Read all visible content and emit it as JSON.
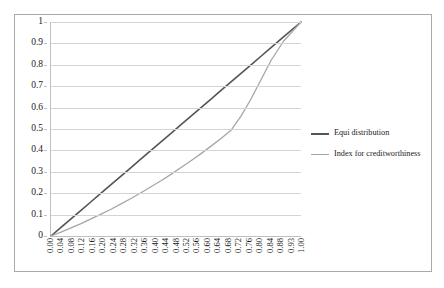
{
  "chart_data": {
    "type": "line",
    "title": "",
    "subtitle": "",
    "xlabel": "",
    "ylabel": "",
    "grid": true,
    "legend_position": "right",
    "xlim": [
      0,
      1
    ],
    "ylim": [
      0,
      1
    ],
    "y_ticks": [
      "0",
      "0.1",
      "0.2",
      "0.3",
      "0.4",
      "0.5",
      "0.6",
      "0.7",
      "0.8",
      "0.9",
      "1"
    ],
    "y_tick_values": [
      0,
      0.1,
      0.2,
      0.3,
      0.4,
      0.5,
      0.6,
      0.7,
      0.8,
      0.9,
      1
    ],
    "categories": [
      "0.00",
      "0.04",
      "0.08",
      "0.12",
      "0.16",
      "0.20",
      "0.24",
      "0.28",
      "0.32",
      "0.36",
      "0.40",
      "0.44",
      "0.48",
      "0.52",
      "0.56",
      "0.60",
      "0.64",
      "0.68",
      "0.72",
      "0.76",
      "0.80",
      "0.84",
      "0.88",
      "0.93",
      "1.00"
    ],
    "x": [
      0.0,
      0.04,
      0.08,
      0.12,
      0.16,
      0.2,
      0.24,
      0.28,
      0.32,
      0.36,
      0.4,
      0.44,
      0.48,
      0.52,
      0.56,
      0.6,
      0.64,
      0.68,
      0.72,
      0.76,
      0.8,
      0.84,
      0.88,
      0.93,
      1.0
    ],
    "series": [
      {
        "name": "Equi distribution",
        "color": "#555555",
        "width": 1.6,
        "values": [
          0.0,
          0.04,
          0.08,
          0.12,
          0.16,
          0.2,
          0.24,
          0.28,
          0.32,
          0.36,
          0.4,
          0.44,
          0.48,
          0.52,
          0.56,
          0.6,
          0.64,
          0.68,
          0.72,
          0.76,
          0.8,
          0.84,
          0.88,
          0.93,
          1.0
        ]
      },
      {
        "name": "Index for creditworthiness",
        "color": "#a6a6a6",
        "width": 1.3,
        "values": [
          0.0,
          0.018,
          0.038,
          0.058,
          0.08,
          0.102,
          0.125,
          0.15,
          0.175,
          0.202,
          0.23,
          0.258,
          0.288,
          0.32,
          0.352,
          0.385,
          0.42,
          0.456,
          0.494,
          0.56,
          0.64,
          0.73,
          0.82,
          0.91,
          1.0
        ]
      }
    ]
  },
  "legend": {
    "items": [
      {
        "label": "Equi distribution",
        "color": "#555555",
        "width": 2
      },
      {
        "label": "Index for creditworthiness",
        "color": "#a6a6a6",
        "width": 1.5
      }
    ]
  },
  "colors": {
    "frame_border": "#a9a9a9",
    "gridline": "#d4d4d4",
    "axis_line": "#bfbfbf",
    "text": "#1a1a1a",
    "background": "#ffffff"
  }
}
